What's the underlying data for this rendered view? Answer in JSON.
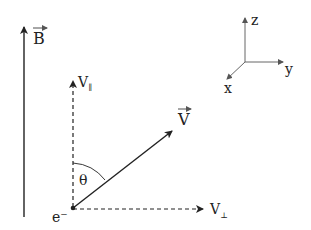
{
  "diagram": {
    "labels": {
      "magnetic_field": "B",
      "velocity": "V",
      "velocity_parallel_base": "V",
      "velocity_parallel_sub": "∥",
      "velocity_perp_base": "V",
      "velocity_perp_sub": "⊥",
      "angle": "θ",
      "electron": "e⁻",
      "axis_x": "x",
      "axis_y": "y",
      "axis_z": "z"
    },
    "colors": {
      "line": "#222222",
      "axes": "#555555",
      "background": "#ffffff"
    }
  }
}
